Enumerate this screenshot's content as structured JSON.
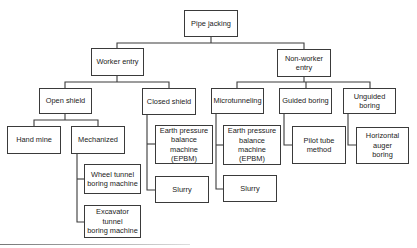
{
  "diagram": {
    "type": "tree",
    "root": {
      "label": "Pipe jacking"
    },
    "nodes": {
      "pipe_jacking": "Pipe jacking",
      "worker_entry": "Worker entry",
      "non_worker_entry": "Non-worker\nentry",
      "open_shield": "Open shield",
      "closed_shield": "Closed shield",
      "microtunneling": "Microtunneling",
      "guided_boring": "Guided boring",
      "unguided_boring": "Unguided\nboring",
      "hand_mine": "Hand mine",
      "mechanized": "Mechanized",
      "wheel_tbm": "Wheel tunnel\nboring machine",
      "excavator_tbm": "Excavator\ntunnel\nboring machine",
      "closed_epbm": "Earth pressure\nbalance\nmachine\n(EPBM)",
      "closed_slurry": "Slurry",
      "micro_epbm": "Earth pressure\nbalance\nmachine\n(EPBM)",
      "micro_slurry": "Slurry",
      "pilot_tube": "Pilot tube\nmethod",
      "horizontal_auger": "Horizontal\nauger\nboring"
    },
    "edges": [
      [
        "Pipe jacking",
        "Worker entry"
      ],
      [
        "Pipe jacking",
        "Non-worker entry"
      ],
      [
        "Worker entry",
        "Open shield"
      ],
      [
        "Worker entry",
        "Closed shield"
      ],
      [
        "Non-worker entry",
        "Microtunneling"
      ],
      [
        "Non-worker entry",
        "Guided boring"
      ],
      [
        "Non-worker entry",
        "Unguided boring"
      ],
      [
        "Open shield",
        "Hand mine"
      ],
      [
        "Open shield",
        "Mechanized"
      ],
      [
        "Mechanized",
        "Wheel tunnel boring machine"
      ],
      [
        "Mechanized",
        "Excavator tunnel boring machine"
      ],
      [
        "Closed shield",
        "Earth pressure balance machine (EPBM)"
      ],
      [
        "Closed shield",
        "Slurry"
      ],
      [
        "Microtunneling",
        "Earth pressure balance machine (EPBM)"
      ],
      [
        "Microtunneling",
        "Slurry"
      ],
      [
        "Guided boring",
        "Pilot tube method"
      ],
      [
        "Unguided boring",
        "Horizontal auger boring"
      ]
    ]
  }
}
